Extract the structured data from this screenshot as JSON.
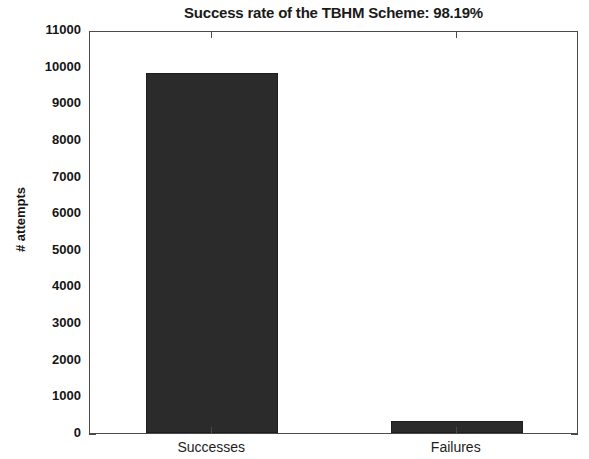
{
  "chart_data": {
    "type": "bar",
    "title": "Success rate of the TBHM Scheme: 98.19%",
    "xlabel": "",
    "ylabel": "# attempts",
    "categories": [
      "Successes",
      "Failures"
    ],
    "values": [
      9825,
      327
    ],
    "ylim": [
      0,
      11000
    ],
    "yticks": [
      0,
      1000,
      2000,
      3000,
      4000,
      5000,
      6000,
      7000,
      8000,
      9000,
      10000,
      11000
    ],
    "ytick_labels": [
      "0",
      "1000",
      "2000",
      "3000",
      "4000",
      "5000",
      "6000",
      "7000",
      "8000",
      "9000",
      "10000",
      "11000"
    ],
    "grid": false,
    "legend": false,
    "bar_color": "#2b2b2b",
    "axis_color": "#4a4a4a",
    "background_color": "#ffffff",
    "success_rate_percent": "98.19%"
  }
}
